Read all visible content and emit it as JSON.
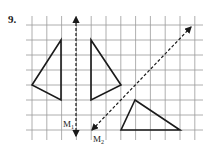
{
  "problem_number": "9.",
  "grid": {
    "x0": 32,
    "y0": 25,
    "dx": 14.8,
    "dy": 15,
    "cols": 12,
    "rows": 8,
    "left": 26,
    "right": 203,
    "top": 16,
    "bottom": 140,
    "color": "#9a9a9a"
  },
  "shapes": [
    {
      "name": "left-triangle",
      "points": [
        [
          61,
          40
        ],
        [
          61,
          100
        ],
        [
          32,
          85
        ]
      ]
    },
    {
      "name": "right-triangle-mirror-m1",
      "points": [
        [
          91,
          40
        ],
        [
          91,
          100
        ],
        [
          121,
          85
        ]
      ]
    },
    {
      "name": "bottom-triangle",
      "points": [
        [
          135,
          100
        ],
        [
          121,
          130
        ],
        [
          180,
          130
        ]
      ]
    }
  ],
  "mirrors": [
    {
      "name": "M1",
      "label": "M",
      "subscript": "1",
      "from": [
        76,
        136
      ],
      "to": [
        76,
        17
      ],
      "label_pos": [
        63,
        127
      ]
    },
    {
      "name": "M2",
      "label": "M",
      "subscript": "2",
      "from": [
        92,
        130
      ],
      "to": [
        191,
        27
      ],
      "label_pos": [
        93,
        142
      ]
    }
  ],
  "colors": {
    "shape": "#1a1a1a",
    "mirror": "#1a1a1a"
  }
}
